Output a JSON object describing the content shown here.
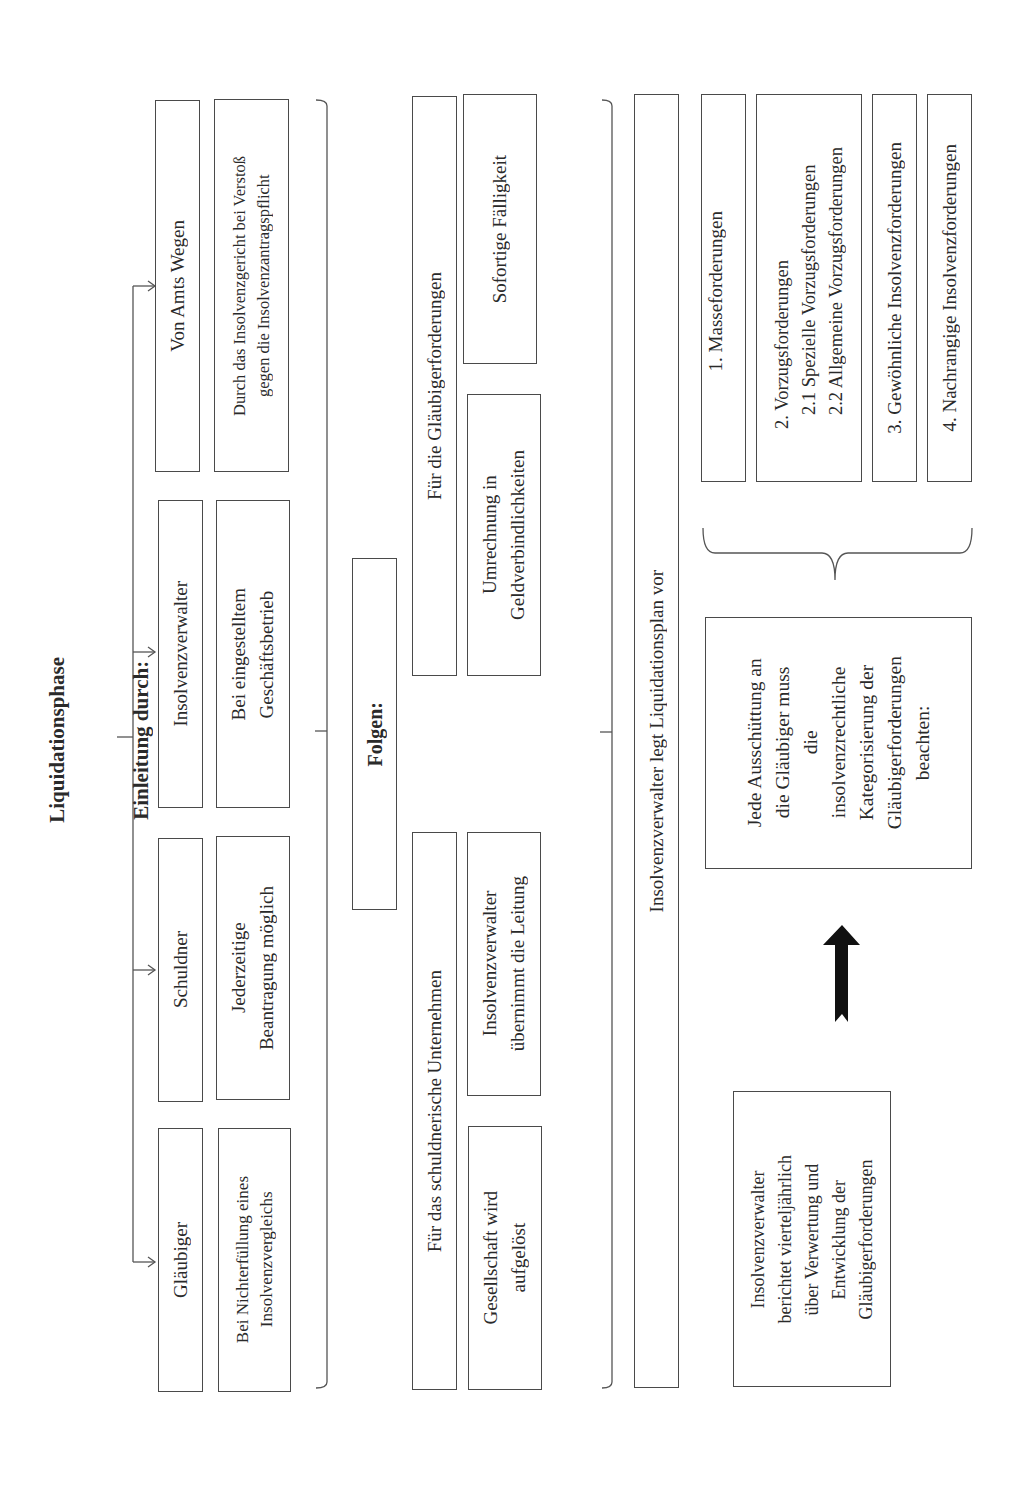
{
  "title": {
    "line1": "Liquidationsphase",
    "line2": "Einleitung durch:"
  },
  "initiators": [
    {
      "label": "Gläubiger",
      "condition": "Bei Nichterfüllung eines\nInsolvenzvergleichs"
    },
    {
      "label": "Schuldner",
      "condition": "Jederzeitige\nBeantragung möglich"
    },
    {
      "label": "Insolvenzverwalter",
      "condition": "Bei eingestelltem\nGeschäftsbetrieb"
    },
    {
      "label": "Von Amts Wegen",
      "condition": "Durch das Insolvenzgericht bei Verstoß\ngegen die Insolvenzantragspflicht"
    }
  ],
  "consequences": {
    "heading": "Folgen:",
    "company": {
      "label": "Für das schuldnerische Unternehmen",
      "items": [
        "Gesellschaft wird\naufgelöst",
        "Insolvenzverwalter\nübernimmt die Leitung"
      ]
    },
    "creditors": {
      "label": "Für die Gläubigerforderungen",
      "items": [
        "Umrechnung in\nGeldverbindlichkeiten",
        "Sofortige Fälligkeit"
      ]
    }
  },
  "plan": {
    "label": "Insolvenzverwalter legt Liquidationsplan vor"
  },
  "report": {
    "text": "Insolvenzverwalter\nberichtet vierteljährlich\nüber Verwertung und\nEntwicklung der\nGläubigerforderungen"
  },
  "distribution": {
    "text": "Jede Ausschüttung an\ndie Gläubiger muss\ndie\ninsolvenzrechtliche\nKategorisierung der\nGläubigerforderungen\nbeachten:"
  },
  "categories": [
    {
      "label": "1. Masseforderungen"
    },
    {
      "label": "2. Vorzugsforderungen\n   2.1 Spezielle Vorzugsforderungen\n   2.2 Allgemeine Vorzugsforderungen"
    },
    {
      "label": "3. Gewöhnliche Insolvenzforderungen"
    },
    {
      "label": "4. Nachrangige Insolvenzforderungen"
    }
  ]
}
